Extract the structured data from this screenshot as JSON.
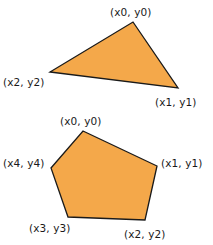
{
  "figure": {
    "background": "#ffffff",
    "shape_fill": "#f5a council",
    "title": ""
  },
  "style": {
    "fill_color": "#f4a84a",
    "stroke_color": "#1a1a1a",
    "stroke_width": 1.3,
    "label_color": "#1a1a1a",
    "background_color": "#ffffff"
  },
  "shapes": [
    {
      "name": "triangle",
      "type": "polygon",
      "vertex_count": 3,
      "points": "133,22 178,88 50,72",
      "vertices": [
        {
          "id": "v0",
          "label": "(x0, y0)",
          "x": 133,
          "y": 22
        },
        {
          "id": "v1",
          "label": "(x1, y1)",
          "x": 178,
          "y": 88
        },
        {
          "id": "v2",
          "label": "(x2, y2)",
          "x": 50,
          "y": 72
        }
      ]
    },
    {
      "name": "pentagon",
      "type": "polygon",
      "vertex_count": 5,
      "points": "83,131 157,166 145,220 68,217 51,168",
      "vertices": [
        {
          "id": "v0",
          "label": "(x0, y0)",
          "x": 83,
          "y": 131
        },
        {
          "id": "v1",
          "label": "(x1, y1)",
          "x": 157,
          "y": 166
        },
        {
          "id": "v2",
          "label": "(x2, y2)",
          "x": 145,
          "y": 220
        },
        {
          "id": "v3",
          "label": "(x3, y3)",
          "x": 68,
          "y": 217
        },
        {
          "id": "v4",
          "label": "(x4, y4)",
          "x": 51,
          "y": 168
        }
      ]
    }
  ],
  "labels": {
    "triangle_v0": "(x0, y0)",
    "triangle_v1": "(x1, y1)",
    "triangle_v2": "(x2, y2)",
    "pentagon_v0": "(x0, y0)",
    "pentagon_v1": "(x1, y1)",
    "pentagon_v2": "(x2, y2)",
    "pentagon_v3": "(x3, y3)",
    "pentagon_v4": "(x4, y4)"
  }
}
